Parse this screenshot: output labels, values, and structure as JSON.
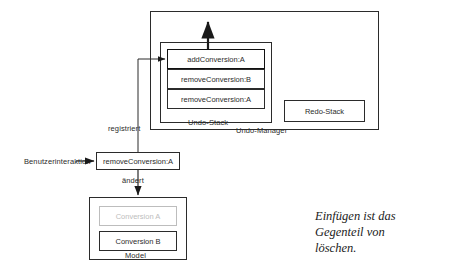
{
  "diagram": {
    "title_caption": "Einfügen ist das\nGegenteil von\nlöschen.",
    "undo_manager": {
      "label": "Undo-Manager",
      "undo_stack": {
        "label": "Undo-Stack",
        "items": [
          {
            "label": "addConversion:A",
            "emphasis": "highlighted"
          },
          {
            "label": "removeConversion:B",
            "emphasis": "normal"
          },
          {
            "label": "removeConversion:A",
            "emphasis": "normal"
          }
        ]
      },
      "redo_stack": {
        "label": "Redo-Stack",
        "items": []
      }
    },
    "command": {
      "label": "removeConversion:A"
    },
    "actor": {
      "label": "Benutzerinteraktion"
    },
    "edges": [
      {
        "label": "registriert"
      },
      {
        "label": "ändert"
      }
    ],
    "model": {
      "label": "Model",
      "items": [
        {
          "label": "Conversion A",
          "state": "ghost"
        },
        {
          "label": "Conversion B",
          "state": "active"
        }
      ]
    },
    "colors": {
      "stroke": "#2b2b2b",
      "ghost": "#bdbdbd",
      "background": "#ffffff"
    }
  }
}
